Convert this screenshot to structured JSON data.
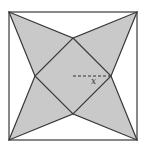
{
  "figure": {
    "type": "geometry-diagram",
    "label": "x",
    "colors": {
      "background": "#ffffff",
      "fill": "#c9c9c9",
      "stroke": "#3a3a3a"
    },
    "square": {
      "x1": 9,
      "y1": 12,
      "x2": 137,
      "y2": 140
    },
    "diamond": {
      "top": [
        73,
        38
      ],
      "right": [
        111,
        76
      ],
      "bottom": [
        73,
        114
      ],
      "left": [
        35,
        76
      ]
    },
    "center": [
      73,
      76
    ],
    "dashed_segment": {
      "from": [
        73,
        76
      ],
      "to": [
        111,
        76
      ],
      "label": "x"
    }
  }
}
